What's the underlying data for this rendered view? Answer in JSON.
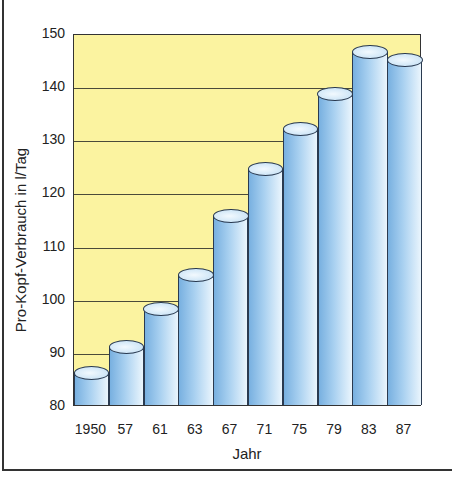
{
  "chart_data": {
    "type": "bar",
    "title": "",
    "xlabel": "Jahr",
    "ylabel": "Pro-Kopf-Verbrauch in l/Tag",
    "categories": [
      "1950",
      "57",
      "61",
      "63",
      "67",
      "71",
      "75",
      "79",
      "83",
      "87"
    ],
    "values": [
      86,
      91,
      98,
      104.5,
      115.5,
      124.5,
      132,
      138.5,
      146.5,
      145
    ],
    "ylim": [
      80,
      150
    ],
    "yticks": [
      80,
      90,
      100,
      110,
      120,
      130,
      140,
      150
    ],
    "grid": true,
    "legend": "none",
    "style": "3d-cylinder",
    "colors": {
      "plot_background": "#fbf3a0",
      "bar_dark": "#78b0e0",
      "bar_light": "#eaf5fd",
      "outline": "#2a3a50"
    }
  }
}
